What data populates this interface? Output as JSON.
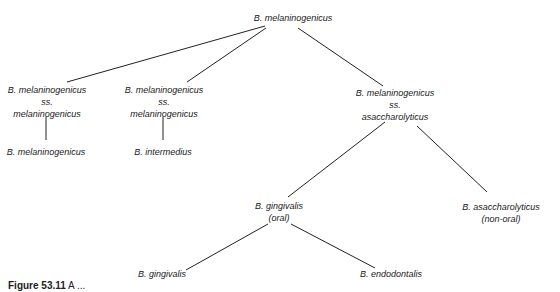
{
  "diagram": {
    "type": "tree",
    "nodes": [
      {
        "id": "root",
        "lines": [
          "B. melaninogenicus"
        ]
      },
      {
        "id": "ssmel1",
        "lines": [
          "B. melaninogenicus",
          "ss.",
          "melaninogenicus"
        ]
      },
      {
        "id": "ssmel2",
        "lines": [
          "B. melaninogenicus",
          "ss.",
          "melaninogenicus"
        ]
      },
      {
        "id": "ssasacch",
        "lines": [
          "B. melaninogenicus",
          "ss.",
          "asaccharolyticus"
        ]
      },
      {
        "id": "bmel",
        "lines": [
          "B. melaninogenicus"
        ]
      },
      {
        "id": "binter",
        "lines": [
          "B. intermedius"
        ]
      },
      {
        "id": "bging_oral",
        "lines": [
          "B. gingivalis",
          "(oral)"
        ]
      },
      {
        "id": "basacch",
        "lines": [
          "B. asaccharolyticus",
          "(non-oral)"
        ]
      },
      {
        "id": "bging",
        "lines": [
          "B. gingivalis"
        ]
      },
      {
        "id": "bendo",
        "lines": [
          "B. endodontalis"
        ]
      }
    ],
    "edges": [
      [
        "root",
        "ssmel1"
      ],
      [
        "root",
        "ssmel2"
      ],
      [
        "root",
        "ssasacch"
      ],
      [
        "ssmel1",
        "bmel"
      ],
      [
        "ssmel2",
        "binter"
      ],
      [
        "ssasacch",
        "bging_oral"
      ],
      [
        "ssasacch",
        "basacch"
      ],
      [
        "bging_oral",
        "bging"
      ],
      [
        "bging_oral",
        "bendo"
      ]
    ]
  },
  "caption": {
    "label": "Figure 53.11",
    "text": " A ..."
  }
}
